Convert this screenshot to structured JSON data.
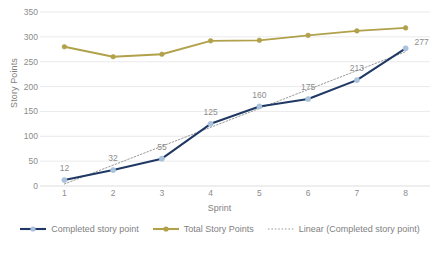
{
  "chart_data": {
    "type": "line",
    "title": "",
    "xlabel": "Sprint",
    "ylabel": "Story Points",
    "categories": [
      "1",
      "2",
      "3",
      "4",
      "5",
      "6",
      "7",
      "8"
    ],
    "ylim": [
      0,
      350
    ],
    "yticks": [
      0,
      50,
      100,
      150,
      200,
      250,
      300,
      350
    ],
    "grid": true,
    "legend_position": "bottom",
    "series": [
      {
        "name": "Completed story point",
        "values": [
          12,
          32,
          55,
          125,
          160,
          175,
          213,
          277
        ],
        "color": "#1f3864",
        "marker_color": "#a9c2dc",
        "labels_shown": true,
        "style": "solid"
      },
      {
        "name": "Total Story Points",
        "values": [
          280,
          260,
          265,
          292,
          293,
          303,
          312,
          318
        ],
        "color": "#b0a14a",
        "marker_color": "#b0a14a",
        "labels_shown": false,
        "style": "solid"
      },
      {
        "name": "Linear (Completed story point)",
        "values": [
          4,
          42,
          80,
          118,
          156,
          194,
          232,
          270
        ],
        "color": "#9a9a9a",
        "labels_shown": false,
        "style": "dotted"
      }
    ]
  },
  "axis": {
    "y_title": "Story Points",
    "x_title": "Sprint",
    "y_tick_labels": [
      "0",
      "50",
      "100",
      "150",
      "200",
      "250",
      "300",
      "350"
    ],
    "x_tick_labels": [
      "1",
      "2",
      "3",
      "4",
      "5",
      "6",
      "7",
      "8"
    ]
  },
  "data_labels": {
    "completed": [
      "12",
      "32",
      "55",
      "125",
      "160",
      "175",
      "213",
      "277"
    ]
  },
  "legend": {
    "items": [
      {
        "label": "Completed story point",
        "icon": "line-marker-icon"
      },
      {
        "label": "Total Story Points",
        "icon": "line-marker-icon"
      },
      {
        "label": "Linear (Completed story point)",
        "icon": "dotted-line-icon"
      }
    ]
  },
  "colors": {
    "completed_line": "#1f3864",
    "completed_marker": "#a9c2dc",
    "total_line": "#b0a14a",
    "trendline": "#9a9a9a",
    "gridline": "#e4e4e4",
    "text": "#7f7f7f",
    "background": "#ffffff"
  }
}
